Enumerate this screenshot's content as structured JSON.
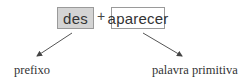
{
  "diagram": {
    "word_parts": [
      {
        "label": "des",
        "role": "prefix",
        "fill": "#d4d4d4"
      },
      {
        "label": "aparecer",
        "role": "base word",
        "fill": "#ffffff"
      }
    ],
    "operator": "+",
    "annotations": [
      {
        "label": "prefixo",
        "points_from": "des"
      },
      {
        "label": "palavra primitiva",
        "points_from": "aparecer"
      }
    ]
  }
}
